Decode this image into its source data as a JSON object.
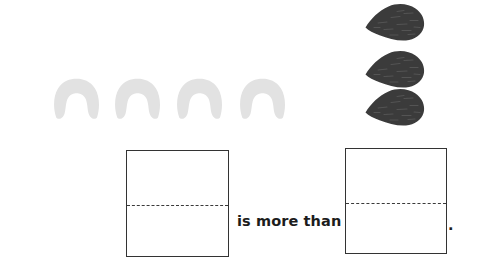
{
  "page": {
    "width": 481,
    "height": 280,
    "background_color": "#ffffff",
    "kind": "comparison-worksheet"
  },
  "comparison": {
    "phrase_label": "is more than",
    "terminator": ".",
    "left_group": {
      "icon_name": "arch-pasta-icon",
      "count": 4,
      "fill_color": "#e2e2e2",
      "positions": [
        {
          "x": 52,
          "y": 78
        },
        {
          "x": 113,
          "y": 78
        },
        {
          "x": 175,
          "y": 78
        },
        {
          "x": 238,
          "y": 78
        }
      ]
    },
    "right_group": {
      "icon_name": "seed-teardrop-icon",
      "count": 3,
      "fill_color": "#3b3b3b",
      "positions": [
        {
          "x": 364,
          "y": 3
        },
        {
          "x": 364,
          "y": 50
        },
        {
          "x": 364,
          "y": 88
        }
      ]
    }
  },
  "answer_boxes": [
    {
      "name": "left-answer-box",
      "value": "",
      "placeholder": "",
      "x": 126,
      "y": 150,
      "width": 103,
      "height": 107,
      "fold_offset": 54,
      "border_color": "#333333"
    },
    {
      "name": "right-answer-box",
      "value": "",
      "placeholder": "",
      "x": 345,
      "y": 148,
      "width": 102,
      "height": 106,
      "fold_offset": 54,
      "border_color": "#333333"
    }
  ],
  "text": {
    "phrase": "is more than",
    "phrase_x": 237,
    "phrase_y": 213,
    "period": ".",
    "period_x": 448,
    "period_y": 218
  },
  "colors": {
    "arch_fill": "#e2e2e2",
    "seed_fill": "#3b3b3b",
    "seed_vein": "#5a5a5a",
    "box_border": "#333333",
    "fold_line": "#3a3a3a",
    "text": "#1c1c1c",
    "background": "#ffffff"
  }
}
